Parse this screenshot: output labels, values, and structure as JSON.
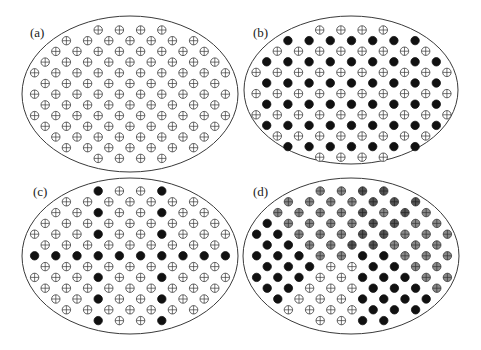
{
  "figure": {
    "legend_codes": {
      "O": "open circle with cross (unoccupied / plus-site)",
      "F": "filled black circle",
      "G": "gray-filled circle with cross",
      "D": "dark-gray circle with cross"
    },
    "colors": {
      "stroke": "#3a3a3a",
      "open_fill": "#ffffff",
      "filled": "#111111",
      "gray": "#8a8a8a",
      "dark_gray": "#555555",
      "ellipse_stroke": "#3a3a3a"
    },
    "row_counts": [
      4,
      7,
      8,
      9,
      10,
      9,
      10,
      9,
      10,
      9,
      8,
      7,
      4
    ],
    "panels": [
      {
        "label": "(a)",
        "label_pos": [
          30,
          37
        ],
        "ellipse": {
          "cx": 130,
          "cy": 94,
          "rx": 108,
          "ry": 78
        },
        "grid": {
          "cx": 130,
          "y0": 30,
          "dy": 10.7,
          "dx": 21.2
        },
        "rows": [
          "OOOO",
          "OOOOOOO",
          "OOOOOOOO",
          "OOOOOOOOO",
          "OOOOOOOOOO",
          "OOOOOOOOO",
          "OOOOOOOOOO",
          "OOOOOOOOO",
          "OOOOOOOOOO",
          "OOOOOOOOO",
          "OOOOOOOO",
          "OOOOOOO",
          "OOOO"
        ]
      },
      {
        "label": "(b)",
        "label_pos": [
          253,
          37
        ],
        "ellipse": {
          "cx": 351,
          "cy": 90,
          "rx": 107,
          "ry": 74
        },
        "grid": {
          "cx": 351.5,
          "y0": 30,
          "dy": 10.6,
          "dx": 21.2
        },
        "rows": [
          "OOOO",
          "FFFFFFF",
          "OOOOOOOO",
          "FFFFFFFFF",
          "OOOOOOOOOO",
          "FFFFFFFFF",
          "OOOOOOOOOO",
          "FFFFFFFFF",
          "OOOOOOOOOO",
          "FFFFFFFFF",
          "OOOOOOOO",
          "FFFFFFF",
          "OOOO"
        ]
      },
      {
        "label": "(c)",
        "label_pos": [
          33,
          196
        ],
        "ellipse": {
          "cx": 130,
          "cy": 256,
          "rx": 108,
          "ry": 78
        },
        "grid": {
          "cx": 130,
          "y0": 191,
          "dy": 10.8,
          "dx": 21.2
        },
        "rows": [
          "FOOF",
          "OOOOOOO",
          "OOFOOFOO",
          "OOOOOOOOO",
          "OOOFOOFOOO",
          "OOOOOOOOO",
          "FFFFFFFFFF",
          "OOOOOOOOO",
          "OOOFOOFOOO",
          "OOOOOOOOO",
          "OOFOOFOO",
          "OOOOOOO",
          "FOOF"
        ]
      },
      {
        "label": "(d)",
        "label_pos": [
          253,
          196
        ],
        "ellipse": {
          "cx": 351,
          "cy": 256,
          "rx": 108,
          "ry": 78
        },
        "grid": {
          "cx": 352,
          "y0": 191,
          "dy": 10.8,
          "dx": 21.2
        },
        "rows": [
          "GGDD",
          "GGGGDDD",
          "GGGGDGDG",
          "FGGGGDDGG",
          "FFGGGDDGGG",
          "FFGGDDGGG",
          "FFFGGFFGGG",
          "FFFOOFFGG",
          "FFFOOFFFGG",
          "FFOOOFFFG",
          "FOOOFFFF",
          "OOOOFFF",
          "OOFF"
        ]
      }
    ]
  }
}
